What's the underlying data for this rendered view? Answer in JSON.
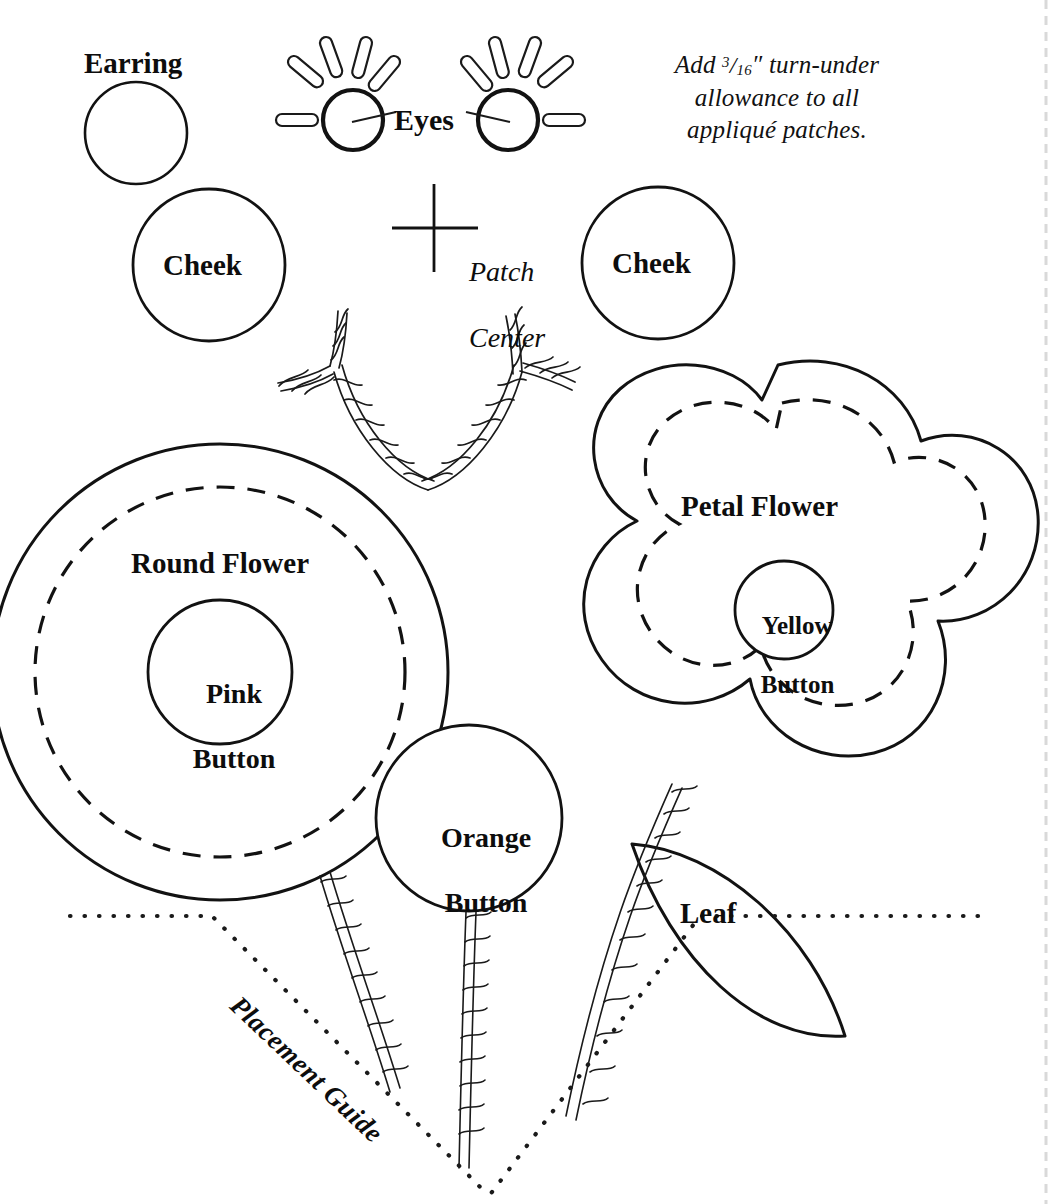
{
  "sheet": {
    "title": "Appliqué Patch Pattern Sheet",
    "background_color": "#ffffff",
    "ink_color": "#0d0d0d",
    "width": 1060,
    "height": 1204
  },
  "note": {
    "line1_pre": "Add ",
    "fraction_numerator": "3",
    "fraction_bar": "/",
    "fraction_denominator": "16",
    "line1_post": "″ turn-under",
    "line2": "allowance to all",
    "line3": "appliqué patches.",
    "full_text": "Add 3/16″ turn-under allowance to all appliqué patches."
  },
  "patches": {
    "earring": {
      "label": "Earring",
      "shape": "circle"
    },
    "eyes": {
      "label": "Eyes",
      "shape": "circle-with-rays",
      "count": 2
    },
    "cheek_left": {
      "label": "Cheek",
      "shape": "circle"
    },
    "cheek_right": {
      "label": "Cheek",
      "shape": "circle"
    },
    "patch_center": {
      "label_line1": "Patch",
      "label_line2": "Center",
      "shape": "crosshair"
    },
    "round_flower": {
      "label": "Round Flower",
      "shape": "circle-with-dashed-inset"
    },
    "pink_button": {
      "label_line1": "Pink",
      "label_line2": "Button",
      "shape": "circle"
    },
    "petal_flower": {
      "label": "Petal Flower",
      "shape": "five-petal-with-dashed-inset"
    },
    "yellow_button": {
      "label_line1": "Yellow",
      "label_line2": "Button",
      "shape": "circle"
    },
    "orange_button": {
      "label_line1": "Orange",
      "label_line2": "Button",
      "shape": "circle"
    },
    "leaf": {
      "label": "Leaf",
      "shape": "pointed-oval"
    },
    "necklace": {
      "shape": "braided-cord"
    },
    "stems": {
      "shape": "braided-cord",
      "count": 3
    }
  },
  "placement_guide": {
    "label": "Placement Guide",
    "line_style": "dotted"
  },
  "trim_mark": {
    "style": "dashed-vertical",
    "color": "#d8d8d8"
  }
}
